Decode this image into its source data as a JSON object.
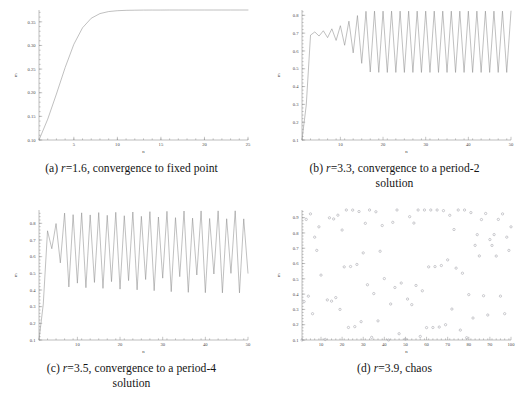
{
  "figure": {
    "title": "",
    "panels": [
      {
        "key": "a",
        "caption_prefix": "(a) ",
        "caption_r": "r",
        "caption_rest": "=1.6, convergence to fixed point",
        "caption_line2": "",
        "caption_full": "(a) r=1.6, convergence to fixed point"
      },
      {
        "key": "b",
        "caption_prefix": "(b) ",
        "caption_r": "r",
        "caption_rest": "=3.3, convergence to a period-2",
        "caption_line2": "solution",
        "caption_full": "(b) r=3.3, convergence to a period-2 solution"
      },
      {
        "key": "c",
        "caption_prefix": "(c) ",
        "caption_r": "r",
        "caption_rest": "=3.5, convergence to a period-4",
        "caption_line2": "solution",
        "caption_full": "(c) r=3.5, convergence to a period-4 solution"
      },
      {
        "key": "d",
        "caption_prefix": "(d) ",
        "caption_r": "r",
        "caption_rest": "=3.9, chaos",
        "caption_line2": "",
        "caption_full": "(d) r=3.9, chaos"
      }
    ]
  },
  "chart_data": [
    {
      "type": "line",
      "panel": "a",
      "title": "(a) r=1.6, convergence to fixed point",
      "xlabel": "n",
      "ylabel": "m",
      "xlim": [
        1,
        25
      ],
      "ylim": [
        0.1,
        0.375
      ],
      "xticks": [
        5,
        10,
        15,
        20,
        25
      ],
      "yticks": [
        0.1,
        0.15,
        0.2,
        0.25,
        0.3,
        0.35
      ],
      "ytick_labels": [
        "0.10",
        "0.15",
        "0.20",
        "0.25",
        "0.30",
        "0.35"
      ],
      "grid": false,
      "legend": "none",
      "r": 1.6,
      "x0": 0.1,
      "x": [
        1,
        2,
        3,
        4,
        5,
        6,
        7,
        8,
        9,
        10,
        11,
        12,
        13,
        14,
        15,
        16,
        17,
        18,
        19,
        20,
        21,
        22,
        23,
        24,
        25
      ],
      "values": [
        0.1,
        0.144,
        0.1972,
        0.2532,
        0.3024,
        0.3374,
        0.3576,
        0.3674,
        0.3717,
        0.3735,
        0.3743,
        0.3746,
        0.3748,
        0.3749,
        0.3749,
        0.375,
        0.375,
        0.375,
        0.375,
        0.375,
        0.375,
        0.375,
        0.375,
        0.375,
        0.375
      ]
    },
    {
      "type": "line",
      "panel": "b",
      "title": "(b) r=3.3, convergence to a period-2 solution",
      "xlabel": "n",
      "ylabel": "m",
      "xlim": [
        1,
        50
      ],
      "ylim": [
        0.1,
        0.83
      ],
      "xticks": [
        10,
        20,
        30,
        40,
        50
      ],
      "yticks": [
        0.1,
        0.2,
        0.3,
        0.4,
        0.5,
        0.6,
        0.7,
        0.8
      ],
      "ytick_labels": [
        "0.1",
        "0.2",
        "0.3",
        "0.4",
        "0.5",
        "0.6",
        "0.7",
        "0.8"
      ],
      "grid": false,
      "legend": "none",
      "r": 3.3,
      "x0": 0.1,
      "note": "transient near 0.70 then growing oscillation to period-2 attractor between 0.4794 and 0.8236",
      "x": [
        1,
        2,
        3,
        4,
        5,
        6,
        7,
        8,
        9,
        10,
        11,
        12,
        13,
        14,
        15,
        16,
        17,
        18,
        19,
        20,
        21,
        22,
        23,
        24,
        25,
        26,
        27,
        28,
        29,
        30,
        31,
        32,
        33,
        34,
        35,
        36,
        37,
        38,
        39,
        40,
        41,
        42,
        43,
        44,
        45,
        46,
        47,
        48,
        49,
        50
      ],
      "values": [
        0.1,
        0.297,
        0.689,
        0.7068,
        0.6838,
        0.7133,
        0.675,
        0.7243,
        0.6591,
        0.7418,
        0.632,
        0.7673,
        0.5891,
        0.7986,
        0.5305,
        0.8226,
        0.4817,
        0.8235,
        0.4796,
        0.8236,
        0.4794,
        0.8236,
        0.4794,
        0.8236,
        0.4794,
        0.8236,
        0.4794,
        0.8236,
        0.4794,
        0.8236,
        0.4794,
        0.8236,
        0.4794,
        0.8236,
        0.4794,
        0.8236,
        0.4794,
        0.8236,
        0.4794,
        0.8236,
        0.4794,
        0.8236,
        0.4794,
        0.8236,
        0.4794,
        0.8236,
        0.4794,
        0.8236,
        0.4794,
        0.8236
      ]
    },
    {
      "type": "line",
      "panel": "c",
      "title": "(c) r=3.5, convergence to a period-4 solution",
      "xlabel": "n",
      "ylabel": "m",
      "xlim": [
        1,
        50
      ],
      "ylim": [
        0.1,
        0.88
      ],
      "xticks": [
        10,
        20,
        30,
        40,
        50
      ],
      "yticks": [
        0.1,
        0.2,
        0.3,
        0.4,
        0.5,
        0.6,
        0.7,
        0.8
      ],
      "ytick_labels": [
        "0.1",
        "0.2",
        "0.3",
        "0.4",
        "0.5",
        "0.6",
        "0.7",
        "0.8"
      ],
      "grid": false,
      "legend": "none",
      "r": 3.5,
      "x0": 0.1,
      "note": "period-4 attractor cycling through 0.3828, 0.8269, 0.5009, 0.8750",
      "x": [
        1,
        2,
        3,
        4,
        5,
        6,
        7,
        8,
        9,
        10,
        11,
        12,
        13,
        14,
        15,
        16,
        17,
        18,
        19,
        20,
        21,
        22,
        23,
        24,
        25,
        26,
        27,
        28,
        29,
        30,
        31,
        32,
        33,
        34,
        35,
        36,
        37,
        38,
        39,
        40,
        41,
        42,
        43,
        44,
        45,
        46,
        47,
        48,
        49,
        50
      ],
      "values": [
        0.1,
        0.315,
        0.7552,
        0.6477,
        0.7986,
        0.5627,
        0.8613,
        0.4183,
        0.852,
        0.4412,
        0.863,
        0.4138,
        0.8504,
        0.4453,
        0.8645,
        0.4098,
        0.8482,
        0.4502,
        0.8662,
        0.4052,
        0.8455,
        0.4563,
        0.868,
        0.401,
        0.842,
        0.463,
        0.87,
        0.396,
        0.838,
        0.471,
        0.872,
        0.39,
        0.834,
        0.48,
        0.8738,
        0.386,
        0.831,
        0.49,
        0.8745,
        0.384,
        0.829,
        0.496,
        0.8748,
        0.383,
        0.8275,
        0.4998,
        0.875,
        0.3828,
        0.8269,
        0.5009
      ]
    },
    {
      "type": "scatter",
      "panel": "d",
      "title": "(d) r=3.9, chaos",
      "xlabel": "n",
      "ylabel": "m",
      "xlim": [
        1,
        100
      ],
      "ylim": [
        0.1,
        0.95
      ],
      "xticks": [
        10,
        20,
        30,
        40,
        50,
        60,
        70,
        80,
        90,
        100
      ],
      "yticks": [
        0.1,
        0.2,
        0.3,
        0.4,
        0.5,
        0.6,
        0.7,
        0.8,
        0.9
      ],
      "ytick_labels": [
        "0.1",
        "0.2",
        "0.3",
        "0.4",
        "0.5",
        "0.6",
        "0.7",
        "0.8",
        "0.9"
      ],
      "grid": false,
      "legend": "none",
      "r": 3.9,
      "x0": 0.1,
      "marker": "open-circle",
      "marker_color": "#a8a8ae",
      "x": [
        1,
        2,
        3,
        4,
        5,
        6,
        7,
        8,
        9,
        10,
        11,
        12,
        13,
        14,
        15,
        16,
        17,
        18,
        19,
        20,
        21,
        22,
        23,
        24,
        25,
        26,
        27,
        28,
        29,
        30,
        31,
        32,
        33,
        34,
        35,
        36,
        37,
        38,
        39,
        40,
        41,
        42,
        43,
        44,
        45,
        46,
        47,
        48,
        49,
        50,
        51,
        52,
        53,
        54,
        55,
        56,
        57,
        58,
        59,
        60,
        61,
        62,
        63,
        64,
        65,
        66,
        67,
        68,
        69,
        70,
        71,
        72,
        73,
        74,
        75,
        76,
        77,
        78,
        79,
        80,
        81,
        82,
        83,
        84,
        85,
        86,
        87,
        88,
        89,
        90,
        91,
        92,
        93,
        94,
        95,
        96,
        97,
        98,
        99,
        100
      ],
      "values": [
        0.1,
        0.351,
        0.8884,
        0.3866,
        0.9246,
        0.272,
        0.7723,
        0.6859,
        0.84,
        0.5242,
        0.9727,
        0.1036,
        0.3621,
        0.899,
        0.354,
        0.8915,
        0.3772,
        0.916,
        0.3,
        0.819,
        0.5782,
        0.9509,
        0.182,
        0.5805,
        0.9494,
        0.1873,
        0.594,
        0.94,
        0.2199,
        0.6695,
        0.8629,
        0.4613,
        0.969,
        0.1172,
        0.4035,
        0.9385,
        0.225,
        0.6802,
        0.8484,
        0.5015,
        0.975,
        0.0951,
        0.3354,
        0.8693,
        0.4432,
        0.9624,
        0.1411,
        0.4725,
        0.9722,
        0.1054,
        0.3677,
        0.9063,
        0.3311,
        0.8645,
        0.4567,
        0.9673,
        0.1234,
        0.4218,
        0.9512,
        0.181,
        0.5782,
        0.951,
        0.1817,
        0.5798,
        0.9502,
        0.1846,
        0.5869,
        0.9458,
        0.1999,
        0.6239,
        0.9153,
        0.3023,
        0.8224,
        0.5699,
        0.9558,
        0.1647,
        0.5366,
        0.9696,
        0.1149,
        0.3967,
        0.933,
        0.2437,
        0.7187,
        0.7889,
        0.6496,
        0.8875,
        0.3894,
        0.9271,
        0.2634,
        0.7566,
        0.7183,
        0.7892,
        0.6489,
        0.8884,
        0.3867,
        0.9246,
        0.272,
        0.7723,
        0.6859,
        0.84
      ]
    }
  ]
}
